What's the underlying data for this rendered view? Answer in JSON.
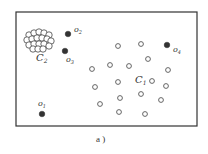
{
  "figure": {
    "caption": "a )",
    "frame": {
      "x": 16,
      "y": 12,
      "width": 181,
      "height": 114
    },
    "colors": {
      "frame": "#333333",
      "outlier": "#333333",
      "point_stroke": "#555555",
      "text": "#333333"
    }
  },
  "clusters": [
    {
      "label_main": "C",
      "label_sub": "1",
      "label_pos": [
        135,
        83
      ],
      "points": [
        [
          118,
          46
        ],
        [
          141,
          44
        ],
        [
          148,
          59
        ],
        [
          110,
          65
        ],
        [
          129,
          66
        ],
        [
          92,
          69
        ],
        [
          168,
          70
        ],
        [
          118,
          82
        ],
        [
          152,
          81
        ],
        [
          95,
          87
        ],
        [
          166,
          86
        ],
        [
          120,
          98
        ],
        [
          141,
          94
        ],
        [
          161,
          100
        ],
        [
          100,
          104
        ],
        [
          119,
          112
        ],
        [
          145,
          114
        ]
      ]
    },
    {
      "label_main": "C",
      "label_sub": "2",
      "label_pos": [
        36,
        61
      ],
      "points": [
        [
          29,
          35
        ],
        [
          34,
          33
        ],
        [
          39,
          32
        ],
        [
          44,
          33
        ],
        [
          49,
          35
        ],
        [
          27,
          40
        ],
        [
          32,
          39
        ],
        [
          37,
          38
        ],
        [
          42,
          38
        ],
        [
          47,
          39
        ],
        [
          51,
          41
        ],
        [
          29,
          45
        ],
        [
          34,
          44
        ],
        [
          39,
          44
        ],
        [
          44,
          44
        ],
        [
          49,
          46
        ],
        [
          33,
          49
        ],
        [
          38,
          49
        ],
        [
          43,
          49
        ]
      ]
    }
  ],
  "outliers": [
    {
      "main": "o",
      "sub": "1",
      "pos": [
        42,
        114
      ],
      "label_pos": [
        38,
        106
      ]
    },
    {
      "main": "o",
      "sub": "2",
      "pos": [
        68,
        34
      ],
      "label_pos": [
        74,
        32
      ]
    },
    {
      "main": "o",
      "sub": "3",
      "pos": [
        65,
        51
      ],
      "label_pos": [
        66,
        62
      ]
    },
    {
      "main": "o",
      "sub": "4",
      "pos": [
        167,
        45
      ],
      "label_pos": [
        173,
        52
      ]
    }
  ]
}
